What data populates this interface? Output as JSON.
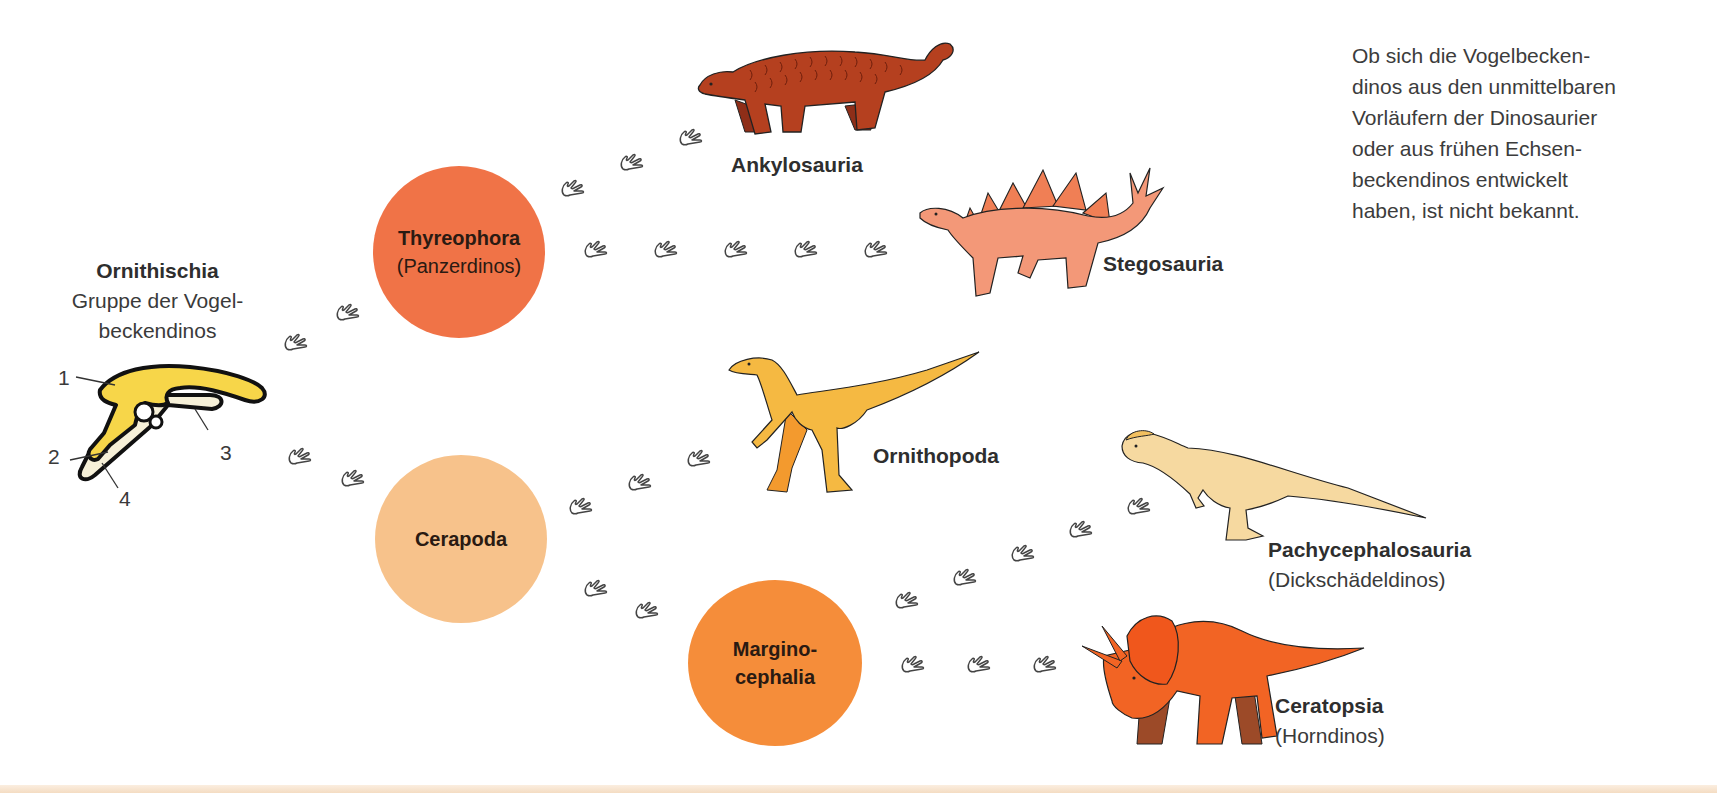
{
  "root": {
    "title": "Ornithischia",
    "subtitle_line1": "Gruppe der Vogel-",
    "subtitle_line2": "beckendinos",
    "pelvis_labels": [
      "1",
      "2",
      "3",
      "4"
    ]
  },
  "groups": [
    {
      "name": "Thyreophora",
      "sub": "(Panzerdinos)",
      "color": "#f07347"
    },
    {
      "name": "Cerapoda",
      "sub": "",
      "color": "#f7c28b"
    },
    {
      "name": "Margino-",
      "name2": "cephalia",
      "color": "#f58d3a"
    }
  ],
  "taxa": [
    {
      "name": "Ankylosauria",
      "sub": "",
      "color": "#b5401f"
    },
    {
      "name": "Stegosauria",
      "sub": "",
      "color": "#f39878"
    },
    {
      "name": "Ornithopoda",
      "sub": "",
      "color": "#f5b942"
    },
    {
      "name": "Pachycephalosauria",
      "sub": "(Dickschädeldinos)",
      "color": "#f6d9a0"
    },
    {
      "name": "Ceratopsia",
      "sub": "(Horndinos)",
      "color": "#f26424"
    }
  ],
  "note": {
    "lines": [
      "Ob sich die Vogelbecken-",
      "dinos aus den unmittelbaren",
      "Vorläufern der Dinosaurier",
      "oder aus frühen Echsen-",
      "beckendinos entwickelt",
      "haben, ist nicht bekannt."
    ]
  },
  "icons": {
    "footprint": "dinosaur-footprint-icon"
  }
}
